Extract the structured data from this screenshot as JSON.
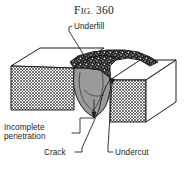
{
  "figure": {
    "title_prefix": "F",
    "title_smallcaps": "IG.",
    "title_number": "360",
    "title_full": "FIG. 360"
  },
  "labels": {
    "underfill": "Underfill",
    "incomplete_penetration_line1": "Incomplete",
    "incomplete_penetration_line2": "penetration",
    "crack": "Crack",
    "undercut": "Undercut"
  },
  "colors": {
    "ink": "#1a1a1a",
    "paper": "#ffffff",
    "weld_cross_section_gray": "#9a9a9a",
    "weld_bead_dark": "#2b2b2b",
    "hatch_line": "#3a3a3a",
    "top_face": "#ffffff",
    "side_face": "#ffffff"
  },
  "defect_callouts": [
    {
      "name": "underfill",
      "label": "Underfill",
      "position": "top"
    },
    {
      "name": "incomplete-penetration",
      "label": "Incomplete penetration",
      "position": "bottom-left"
    },
    {
      "name": "crack",
      "label": "Crack",
      "position": "bottom-center"
    },
    {
      "name": "undercut",
      "label": "Undercut",
      "position": "bottom-right"
    }
  ]
}
